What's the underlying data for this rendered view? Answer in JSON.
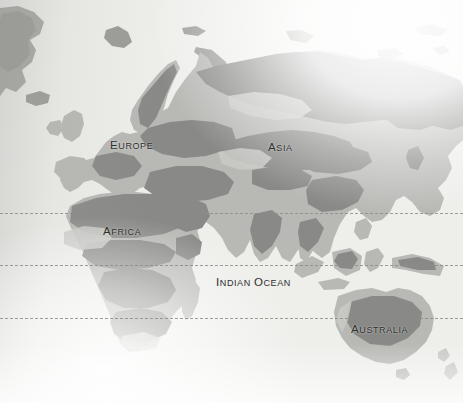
{
  "figure": {
    "name": "eastern-hemisphere-physical-map",
    "width": 463,
    "height": 403
  },
  "colors": {
    "paper": "#eeeeeb",
    "land_dark": "#8d8d8b",
    "land_mid": "#a8a8a5",
    "land_light": "#c2c2bf",
    "label_text": "#2e2e2e",
    "graticule": "#8d8d8a"
  },
  "labels": [
    {
      "id": "europe",
      "text": "EUROPE",
      "first": "E",
      "rest": "UROPE",
      "x": 110,
      "y": 136
    },
    {
      "id": "asia",
      "text": "ASIA",
      "first": "A",
      "rest": "SIA",
      "x": 268,
      "y": 138
    },
    {
      "id": "africa",
      "text": "AFRICA",
      "first": "A",
      "rest": "FRICA",
      "x": 103,
      "y": 222
    },
    {
      "id": "indian-ocean",
      "text": "INDIAN OCEAN",
      "first": "I",
      "rest": "NDIAN ",
      "x": 216,
      "y": 273,
      "second_first": "O",
      "second_rest": "CEAN"
    },
    {
      "id": "australia",
      "text": "AUSTRALIA",
      "first": "A",
      "rest": "USTRALIA",
      "x": 351,
      "y": 320
    }
  ],
  "graticule": [
    {
      "id": "tropic-of-cancer",
      "y": 213
    },
    {
      "id": "equator",
      "y": 265
    },
    {
      "id": "tropic-of-capricorn",
      "y": 318
    }
  ]
}
